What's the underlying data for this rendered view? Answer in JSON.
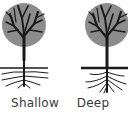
{
  "diagram": {
    "type": "comparison",
    "colors": {
      "canopy": "#8c8c8c",
      "branches": "#1a1a1a",
      "ground_line": "#1a1a1a",
      "label_text": "#3a3a3a",
      "background": "#ffffff"
    },
    "panels": [
      {
        "label": "Shallow",
        "icon": "tree-shallow-roots-icon",
        "root_style": "horizontal spreading roots near surface"
      },
      {
        "label": "Deep",
        "icon": "tree-deep-roots-icon",
        "root_style": "roots extending downward"
      }
    ]
  }
}
